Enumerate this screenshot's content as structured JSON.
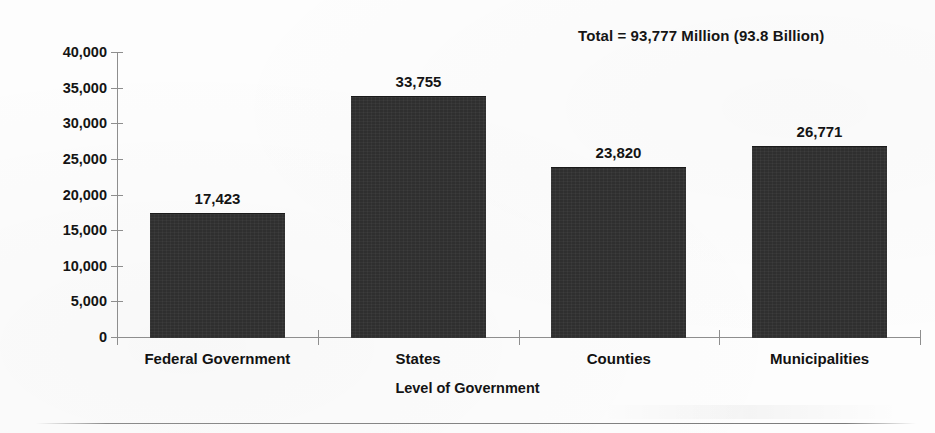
{
  "chart_data": {
    "type": "bar",
    "title": "",
    "subtitle": "",
    "xlabel": "Level of Government",
    "ylabel": "",
    "categories": [
      "Federal Government",
      "States",
      "Counties",
      "Municipalities"
    ],
    "values": [
      17423,
      33755,
      23820,
      26771
    ],
    "value_labels": [
      "17,423",
      "33,755",
      "23,820",
      "26,771"
    ],
    "ylim": [
      0,
      40000
    ],
    "ytick_values": [
      0,
      5000,
      10000,
      15000,
      20000,
      25000,
      30000,
      35000,
      40000
    ],
    "ytick_labels": [
      "0",
      "5,000",
      "10,000",
      "15,000",
      "20,000",
      "25,000",
      "30,000",
      "35,000",
      "40,000"
    ],
    "grid": false,
    "legend": false,
    "legend_position": "none",
    "annotations": [
      {
        "name": "total-annotation",
        "text": "Total = 93,777 Million (93.8 Billion)",
        "position": "top-right"
      }
    ],
    "bar_color": "#2f2f2f",
    "axis_color": "#8e8e8e",
    "text_color": "#141414",
    "background_color": "#ffffff"
  },
  "annotation": {
    "total_text": "Total = 93,777 Million (93.8 Billion)"
  },
  "axes": {
    "x_title": "Level of Government"
  }
}
